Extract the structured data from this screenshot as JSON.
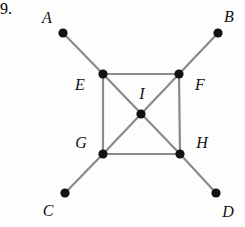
{
  "figure": {
    "problem_number": "9.",
    "background_color": "#fdfdfd",
    "edge_color": "#8a8a8a",
    "node_color": "#121212",
    "label_color": "#111111",
    "edge_width": 2.2,
    "node_radius": 4.6,
    "width": 245,
    "height": 227
  },
  "nodes": [
    {
      "id": "A",
      "label": "A",
      "x": 63,
      "y": 33,
      "label_x": 47,
      "label_y": 18
    },
    {
      "id": "B",
      "label": "B",
      "x": 218,
      "y": 33,
      "label_x": 229,
      "label_y": 17
    },
    {
      "id": "C",
      "label": "C",
      "x": 65,
      "y": 193,
      "label_x": 48,
      "label_y": 211
    },
    {
      "id": "D",
      "label": "D",
      "x": 216,
      "y": 193,
      "label_x": 228,
      "label_y": 212
    },
    {
      "id": "E",
      "label": "E",
      "x": 103,
      "y": 74,
      "label_x": 80,
      "label_y": 85
    },
    {
      "id": "F",
      "label": "F",
      "x": 179,
      "y": 74,
      "label_x": 200,
      "label_y": 85
    },
    {
      "id": "G",
      "label": "G",
      "x": 103,
      "y": 154,
      "label_x": 81,
      "label_y": 143
    },
    {
      "id": "H",
      "label": "H",
      "x": 180,
      "y": 154,
      "label_x": 202,
      "label_y": 143
    },
    {
      "id": "I",
      "label": "I",
      "x": 141,
      "y": 114,
      "label_x": 142,
      "label_y": 94
    }
  ],
  "edges": [
    {
      "from": "A",
      "to": "E"
    },
    {
      "from": "B",
      "to": "F"
    },
    {
      "from": "C",
      "to": "G"
    },
    {
      "from": "D",
      "to": "H"
    },
    {
      "from": "E",
      "to": "F"
    },
    {
      "from": "E",
      "to": "G"
    },
    {
      "from": "F",
      "to": "H"
    },
    {
      "from": "G",
      "to": "H"
    },
    {
      "from": "E",
      "to": "H"
    },
    {
      "from": "F",
      "to": "G"
    }
  ]
}
